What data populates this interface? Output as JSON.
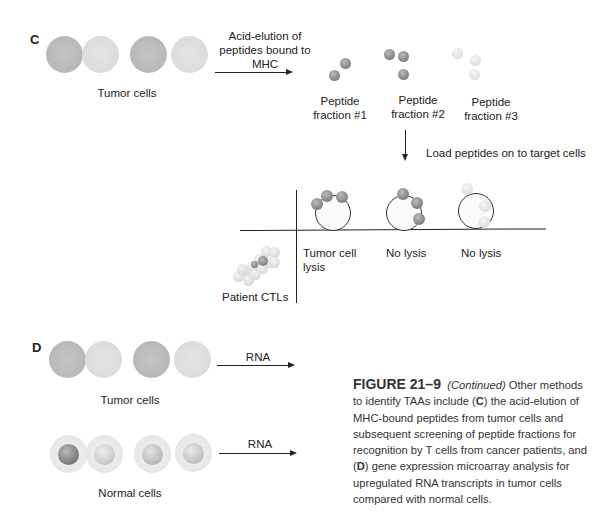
{
  "panel_c": {
    "letter": "C",
    "tumor_cells_label": "Tumor cells",
    "elution_label_line1": "Acid-elution of",
    "elution_label_line2": "peptides bound to",
    "elution_label_line3": "MHC",
    "fractions": [
      {
        "line1": "Peptide",
        "line2": "fraction #1"
      },
      {
        "line1": "Peptide",
        "line2": "fraction #2"
      },
      {
        "line1": "Peptide",
        "line2": "fraction #3"
      }
    ],
    "load_label": "Load peptides on to target cells",
    "results": [
      {
        "line1": "Tumor cell",
        "line2": "lysis"
      },
      {
        "line1": "No lysis",
        "line2": ""
      },
      {
        "line1": "No lysis",
        "line2": ""
      }
    ],
    "ctl_label": "Patient CTLs"
  },
  "panel_d": {
    "letter": "D",
    "tumor_cells_label": "Tumor cells",
    "normal_cells_label": "Normal cells",
    "rna_label_1": "RNA",
    "rna_label_2": "RNA"
  },
  "caption": {
    "figure": "FIGURE 21–9",
    "continued": "(Continued)",
    "text_1": " Other methods to identify TAAs include (",
    "c": "C",
    "text_2": ") the acid-elution of MHC-bound peptides from tumor cells and subsequent screening of peptide fractions for recognition by T cells from cancer patients, and (",
    "d": "D",
    "text_3": ") gene expression microarray analysis for upregulated RNA transcripts in tumor cells compared with normal cells."
  },
  "colors": {
    "line": "#222222",
    "tumor_dark": "#b8b8b8",
    "tumor_light": "#dcdcdc",
    "peptide_dark": "#888888",
    "peptide_light": "#e2e2e2"
  }
}
